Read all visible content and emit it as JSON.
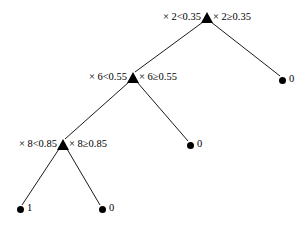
{
  "figure": {
    "type": "decision-tree",
    "background_color": "#ffffff",
    "ink_color": "#000000"
  },
  "nodes": [
    {
      "id": "root",
      "kind": "split",
      "marker": "triangle-marker",
      "x": 207,
      "y": 18,
      "left_label": "× 2<0.35",
      "right_label": "× 2≥0.35"
    },
    {
      "id": "n2",
      "kind": "split",
      "marker": "triangle-marker",
      "x": 133,
      "y": 78,
      "left_label": "× 6<0.55",
      "right_label": "× 6≥0.55"
    },
    {
      "id": "n3",
      "kind": "split",
      "marker": "triangle-marker",
      "x": 63,
      "y": 145,
      "left_label": "× 8<0.85",
      "right_label": "× 8≥0.85"
    },
    {
      "id": "leaf_root_right",
      "kind": "leaf",
      "marker": "circle-marker",
      "x": 282,
      "y": 80,
      "value": "0"
    },
    {
      "id": "leaf_n2_right",
      "kind": "leaf",
      "marker": "circle-marker",
      "x": 190,
      "y": 145,
      "value": "0"
    },
    {
      "id": "leaf_n3_left",
      "kind": "leaf",
      "marker": "circle-marker",
      "x": 20,
      "y": 209,
      "value": "1"
    },
    {
      "id": "leaf_n3_right",
      "kind": "leaf",
      "marker": "circle-marker",
      "x": 102,
      "y": 209,
      "value": "0"
    }
  ],
  "edges": [
    {
      "id": "root-to-n2",
      "from": "root",
      "to": "n2",
      "x1": 203,
      "y1": 22,
      "x2": 135,
      "y2": 72
    },
    {
      "id": "root-to-leaf0",
      "from": "root",
      "to": "leaf_root_right",
      "x1": 211,
      "y1": 22,
      "x2": 280,
      "y2": 76
    },
    {
      "id": "n2-to-n3",
      "from": "n2",
      "to": "n3",
      "x1": 129,
      "y1": 82,
      "x2": 65,
      "y2": 139
    },
    {
      "id": "n2-to-leaf0",
      "from": "n2",
      "to": "leaf_n2_right",
      "x1": 137,
      "y1": 82,
      "x2": 188,
      "y2": 141
    },
    {
      "id": "n3-to-leaf1",
      "from": "n3",
      "to": "leaf_n3_left",
      "x1": 59,
      "y1": 149,
      "x2": 22,
      "y2": 205
    },
    {
      "id": "n3-to-leaf0",
      "from": "n3",
      "to": "leaf_n3_right",
      "x1": 67,
      "y1": 149,
      "x2": 100,
      "y2": 205
    }
  ]
}
